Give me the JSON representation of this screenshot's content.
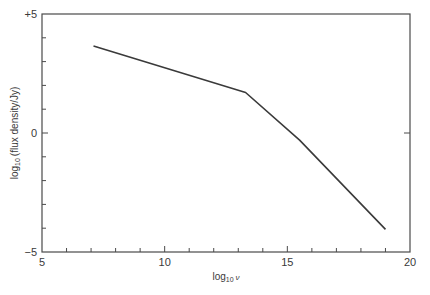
{
  "chart_data": {
    "type": "line",
    "title": "",
    "xlabel": "log10 ν",
    "ylabel": "log10 (flux density/Jy)",
    "xlabel_parts": {
      "main": "log",
      "sub": "10",
      "var": "ν"
    },
    "ylabel_parts": {
      "main": "log",
      "sub": "10",
      "rest": "(flux density/Jy)"
    },
    "xlim": [
      5,
      20
    ],
    "ylim": [
      -5,
      5
    ],
    "x_ticks_major": [
      5,
      10,
      15,
      20
    ],
    "x_tick_labels": [
      "5",
      "10",
      "15",
      "20"
    ],
    "x_ticks_minor_step": 1,
    "y_ticks_major": [
      5,
      0,
      -5
    ],
    "y_tick_labels": [
      "+5",
      "0",
      "−5"
    ],
    "y_ticks_minor_step": 1,
    "grid": false,
    "legend": null,
    "series": [
      {
        "name": "spectrum",
        "color": "#3a3a3a",
        "x": [
          7.1,
          13.3,
          15.5,
          19.0
        ],
        "y": [
          3.65,
          1.7,
          -0.3,
          -4.05
        ]
      }
    ]
  }
}
